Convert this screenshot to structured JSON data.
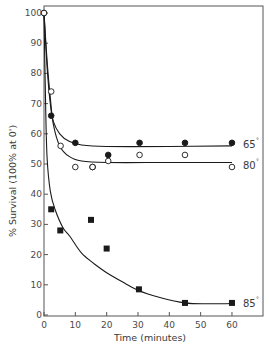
{
  "chart_data": {
    "type": "scatter",
    "title": "",
    "xlabel": "Time (minutes)",
    "ylabel": "% Survival (100% at 0')",
    "xlim": [
      0,
      70
    ],
    "ylim": [
      0,
      103
    ],
    "x_ticks": [
      0,
      10,
      20,
      30,
      40,
      50,
      60
    ],
    "y_ticks": [
      0,
      10,
      20,
      30,
      40,
      50,
      60,
      70,
      80,
      90,
      100
    ],
    "grid": false,
    "legend": "inline labels at right end of each curve",
    "series": [
      {
        "name": "65°",
        "label": "65",
        "marker": "filled-circle",
        "points": [
          {
            "x": 0,
            "y": 100
          },
          {
            "x": 2.3,
            "y": 66
          },
          {
            "x": 10,
            "y": 57
          },
          {
            "x": 15.5,
            "y": 49
          },
          {
            "x": 20.5,
            "y": 53
          },
          {
            "x": 30.5,
            "y": 57
          },
          {
            "x": 45,
            "y": 57
          },
          {
            "x": 60,
            "y": 57
          }
        ],
        "curve": [
          {
            "x": 0,
            "y": 100
          },
          {
            "x": 1,
            "y": 82
          },
          {
            "x": 2,
            "y": 70
          },
          {
            "x": 3,
            "y": 64
          },
          {
            "x": 5,
            "y": 60
          },
          {
            "x": 8,
            "y": 57.5
          },
          {
            "x": 12,
            "y": 56.3
          },
          {
            "x": 20,
            "y": 55.8
          },
          {
            "x": 40,
            "y": 55.8
          },
          {
            "x": 60,
            "y": 56
          }
        ]
      },
      {
        "name": "80°",
        "label": "80",
        "marker": "open-circle",
        "points": [
          {
            "x": 0,
            "y": 100
          },
          {
            "x": 2.3,
            "y": 74
          },
          {
            "x": 5.3,
            "y": 56
          },
          {
            "x": 10,
            "y": 49
          },
          {
            "x": 15.5,
            "y": 49
          },
          {
            "x": 20.5,
            "y": 51
          },
          {
            "x": 30.5,
            "y": 53
          },
          {
            "x": 45,
            "y": 53
          },
          {
            "x": 60,
            "y": 49
          }
        ],
        "curve": [
          {
            "x": 0,
            "y": 100
          },
          {
            "x": 1,
            "y": 84
          },
          {
            "x": 2,
            "y": 72
          },
          {
            "x": 3,
            "y": 63
          },
          {
            "x": 5,
            "y": 56
          },
          {
            "x": 8,
            "y": 52.5
          },
          {
            "x": 12,
            "y": 51
          },
          {
            "x": 20,
            "y": 50.5
          },
          {
            "x": 40,
            "y": 50.5
          },
          {
            "x": 60,
            "y": 50.5
          }
        ]
      },
      {
        "name": "85°",
        "label": "85",
        "marker": "filled-square",
        "points": [
          {
            "x": 2.3,
            "y": 35
          },
          {
            "x": 5.2,
            "y": 28
          },
          {
            "x": 15,
            "y": 31.5
          },
          {
            "x": 20,
            "y": 22
          },
          {
            "x": 30.3,
            "y": 8.5
          },
          {
            "x": 45,
            "y": 4
          },
          {
            "x": 60,
            "y": 4
          }
        ],
        "curve": [
          {
            "x": 0,
            "y": 100
          },
          {
            "x": 0.5,
            "y": 70
          },
          {
            "x": 1,
            "y": 52
          },
          {
            "x": 2,
            "y": 41
          },
          {
            "x": 3.5,
            "y": 35
          },
          {
            "x": 6,
            "y": 29
          },
          {
            "x": 8.3,
            "y": 26
          },
          {
            "x": 12,
            "y": 20.5
          },
          {
            "x": 16,
            "y": 17
          },
          {
            "x": 20,
            "y": 14
          },
          {
            "x": 25,
            "y": 11
          },
          {
            "x": 30,
            "y": 8.2
          },
          {
            "x": 37,
            "y": 5.8
          },
          {
            "x": 45,
            "y": 4
          },
          {
            "x": 52,
            "y": 3.7
          },
          {
            "x": 60,
            "y": 3.8
          }
        ]
      }
    ],
    "annotations": [
      {
        "text": "65",
        "superscript": "°",
        "near_series": "65°"
      },
      {
        "text": "80",
        "superscript": "°",
        "near_series": "80°"
      },
      {
        "text": "85",
        "superscript": "°",
        "near_series": "85°"
      }
    ]
  },
  "colors": {
    "ink": "#1a1a1a",
    "axis": "#555555",
    "text": "#3a3a3a",
    "background": "#ffffff"
  },
  "layout": {
    "plot_left": 44,
    "plot_top": 6,
    "plot_right": 263,
    "plot_bottom": 316,
    "x_px_per_unit": 3.133,
    "y_zero_px": 315,
    "y_px_per_unit": 3.02
  }
}
